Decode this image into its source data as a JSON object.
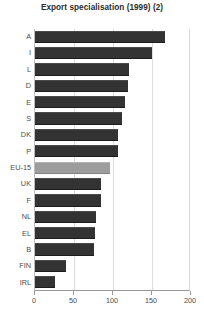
{
  "chart_data": {
    "type": "bar",
    "orientation": "horizontal",
    "title": "Export specialisation (1999) (2)",
    "xlabel": "",
    "ylabel": "",
    "xlim": [
      0,
      200
    ],
    "xticks": [
      0,
      50,
      100,
      150,
      200
    ],
    "grid": true,
    "grid_axis": "x",
    "legend": null,
    "categories": [
      "A",
      "I",
      "L",
      "D",
      "E",
      "S",
      "DK",
      "P",
      "EU-15",
      "UK",
      "F",
      "NL",
      "EL",
      "B",
      "FIN",
      "IRL"
    ],
    "values": [
      167,
      150,
      120,
      119,
      115,
      112,
      107,
      106,
      96,
      85,
      84,
      78,
      77,
      76,
      40,
      26
    ],
    "highlight_category": "EU-15",
    "colors": {
      "bar": "#333333",
      "bar_highlight": "#9d9d9d",
      "grid": "#dcdcdc",
      "axis": "#9a9a9a",
      "text": "#4d4d4d",
      "title": "#2b2b2b",
      "background": "#ffffff"
    }
  }
}
